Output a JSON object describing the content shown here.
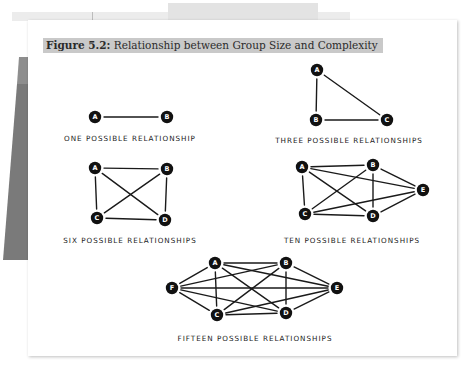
{
  "figure": {
    "number_label": "Figure 5.2:",
    "title": "Relationship between Group Size and Complexity"
  },
  "diagrams": [
    {
      "id": "two",
      "caption": "ONE POSSIBLE RELATIONSHIP",
      "nodes": [
        {
          "label": "A",
          "x": 95,
          "y": 117
        },
        {
          "label": "B",
          "x": 167,
          "y": 117
        }
      ],
      "edges": [
        [
          "A",
          "B"
        ]
      ],
      "caption_x": 130,
      "caption_y": 141
    },
    {
      "id": "three",
      "caption": "THREE POSSIBLE RELATIONSHIPS",
      "nodes": [
        {
          "label": "A",
          "x": 317,
          "y": 70
        },
        {
          "label": "B",
          "x": 316,
          "y": 120
        },
        {
          "label": "C",
          "x": 387,
          "y": 120
        }
      ],
      "edges": [
        [
          "A",
          "B"
        ],
        [
          "A",
          "C"
        ],
        [
          "B",
          "C"
        ]
      ],
      "caption_x": 349,
      "caption_y": 143
    },
    {
      "id": "four",
      "caption": "SIX POSSIBLE RELATIONSHIPS",
      "nodes": [
        {
          "label": "A",
          "x": 95,
          "y": 168
        },
        {
          "label": "B",
          "x": 167,
          "y": 169
        },
        {
          "label": "C",
          "x": 97,
          "y": 218
        },
        {
          "label": "D",
          "x": 165,
          "y": 220
        }
      ],
      "edges": [
        [
          "A",
          "B"
        ],
        [
          "A",
          "C"
        ],
        [
          "A",
          "D"
        ],
        [
          "B",
          "C"
        ],
        [
          "B",
          "D"
        ],
        [
          "C",
          "D"
        ]
      ],
      "caption_x": 130,
      "caption_y": 243
    },
    {
      "id": "five",
      "caption": "TEN POSSIBLE RELATIONSHIPS",
      "nodes": [
        {
          "label": "A",
          "x": 302,
          "y": 167
        },
        {
          "label": "B",
          "x": 373,
          "y": 165
        },
        {
          "label": "C",
          "x": 305,
          "y": 214
        },
        {
          "label": "D",
          "x": 373,
          "y": 216
        },
        {
          "label": "E",
          "x": 423,
          "y": 190
        }
      ],
      "edges": [
        [
          "A",
          "B"
        ],
        [
          "A",
          "C"
        ],
        [
          "A",
          "D"
        ],
        [
          "A",
          "E"
        ],
        [
          "B",
          "C"
        ],
        [
          "B",
          "D"
        ],
        [
          "B",
          "E"
        ],
        [
          "C",
          "D"
        ],
        [
          "C",
          "E"
        ],
        [
          "D",
          "E"
        ]
      ],
      "caption_x": 352,
      "caption_y": 243
    },
    {
      "id": "six",
      "caption": "FIFTEEN POSSIBLE RELATIONSHIPS",
      "nodes": [
        {
          "label": "A",
          "x": 215,
          "y": 263
        },
        {
          "label": "B",
          "x": 286,
          "y": 263
        },
        {
          "label": "C",
          "x": 217,
          "y": 315
        },
        {
          "label": "D",
          "x": 286,
          "y": 313
        },
        {
          "label": "E",
          "x": 337,
          "y": 288
        },
        {
          "label": "F",
          "x": 172,
          "y": 288
        }
      ],
      "edges": [
        [
          "A",
          "B"
        ],
        [
          "A",
          "C"
        ],
        [
          "A",
          "D"
        ],
        [
          "A",
          "E"
        ],
        [
          "A",
          "F"
        ],
        [
          "B",
          "C"
        ],
        [
          "B",
          "D"
        ],
        [
          "B",
          "E"
        ],
        [
          "B",
          "F"
        ],
        [
          "C",
          "D"
        ],
        [
          "C",
          "E"
        ],
        [
          "C",
          "F"
        ],
        [
          "D",
          "E"
        ],
        [
          "D",
          "F"
        ],
        [
          "E",
          "F"
        ]
      ],
      "caption_x": 255,
      "caption_y": 341
    }
  ],
  "colors": {
    "node_fill": "#111111",
    "edge_stroke": "#1a1a1a",
    "header_bg": "#c9c9c9",
    "left_shape_light": "#8e8e8e",
    "left_shape_dark": "#7a7a7a"
  }
}
